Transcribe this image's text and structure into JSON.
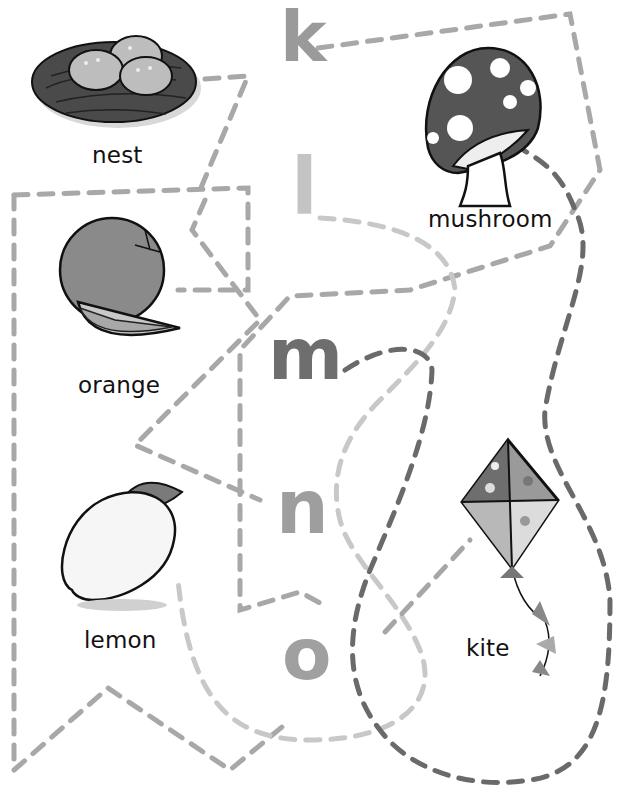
{
  "worksheet": {
    "type": "letter-picture matching by dashed paths",
    "letters": [
      {
        "char": "k",
        "color": "#9a9a9a"
      },
      {
        "char": "l",
        "color": "#c4c4c4"
      },
      {
        "char": "m",
        "color": "#6e6e6e"
      },
      {
        "char": "n",
        "color": "#9e9e9e"
      },
      {
        "char": "o",
        "color": "#a0a0a0"
      }
    ],
    "pictures": [
      {
        "label": "nest",
        "icon": "nest-icon"
      },
      {
        "label": "mushroom",
        "icon": "mushroom-icon"
      },
      {
        "label": "orange",
        "icon": "orange-icon"
      },
      {
        "label": "lemon",
        "icon": "lemon-icon"
      },
      {
        "label": "kite",
        "icon": "kite-icon"
      }
    ],
    "path_colors": {
      "k_path": "#a8a8a8",
      "l_path": "#c8c8c8",
      "m_path": "#6a6a6a",
      "n_path": "#a6a6a6",
      "o_path": "#c2c2c2"
    }
  }
}
